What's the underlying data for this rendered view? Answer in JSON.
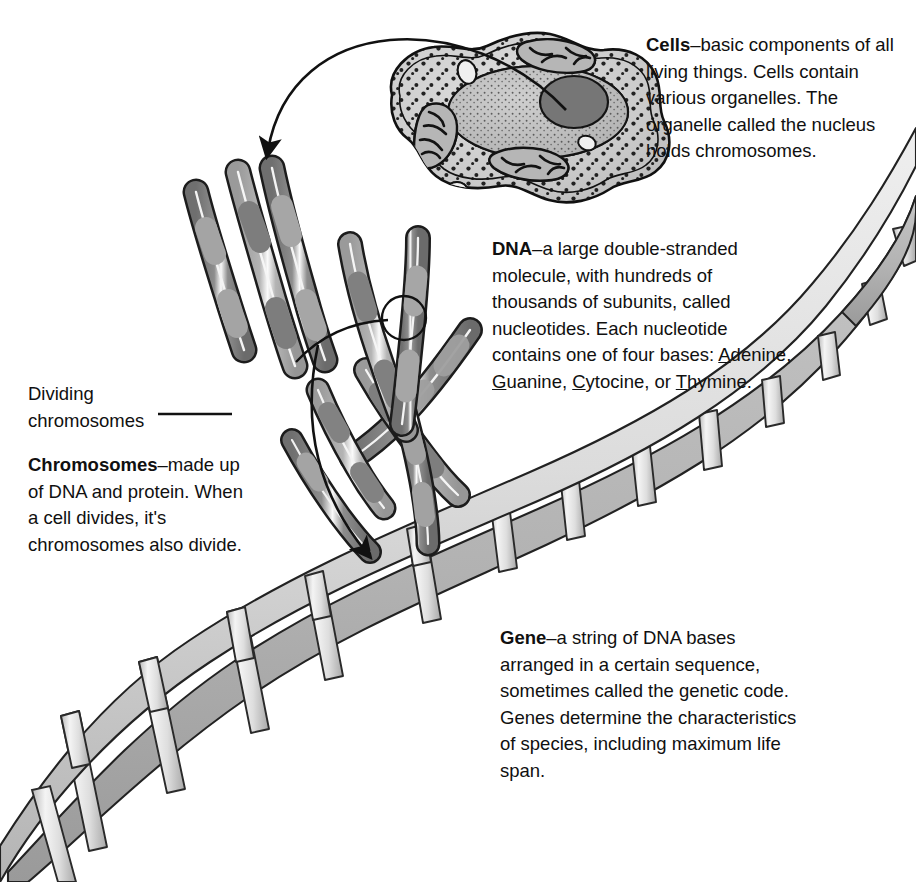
{
  "figure": {
    "background_color": "#ffffff",
    "text_color": "#101010"
  },
  "callouts": {
    "cells": {
      "term": "Cells",
      "dash": "–",
      "body": "basic components of all living things. Cells contain various organelles. The organelle called the nucleus holds chromosomes."
    },
    "dna": {
      "term": "DNA",
      "dash": "–",
      "body_part1": "a large double-stranded molecule, with hundreds of thousands of subunits, called nucleotides. Each nucleotide contains one of four bases: ",
      "bases": [
        {
          "initial": "A",
          "rest": "denine"
        },
        {
          "initial": "G",
          "rest": "uanine"
        },
        {
          "initial": "C",
          "rest": "ytocine"
        },
        {
          "initial": "T",
          "rest": "hymine"
        }
      ],
      "base_separator": ", ",
      "base_conjunction": "or ",
      "body_end": "."
    },
    "dividing": {
      "line1": "Dividing",
      "line2": "chromosomes"
    },
    "chromosomes": {
      "term": "Chromosomes",
      "dash": "–",
      "body": "made up of DNA and protein. When a cell divides, it's chromosomes also divide."
    },
    "gene": {
      "term": "Gene",
      "dash": "–",
      "body": "a string of DNA bases arranged in a certain sequence, sometimes called the genetic code. Genes determine the characteristics of species, including maximum life span."
    }
  },
  "illustrations": {
    "cell": {
      "name": "animal-cell",
      "membrane_fill": "#d0d0d0",
      "cytoplasm_fill": "#cbcbcb",
      "nucleus_fill": "#bdbdbd",
      "nucleolus_fill": "#7d7d7d",
      "outline": "#111111",
      "parts": [
        "cell-membrane",
        "cytoplasm",
        "nucleus",
        "nucleolus",
        "mitochondria",
        "ribosomes",
        "vacuoles"
      ],
      "mitochondria_count": 3,
      "ribosome_dot_count": 150
    },
    "chromosomes": {
      "name": "chromosome-set",
      "band_dark": "#7f7f7f",
      "band_light": "#a9a9a9",
      "outline": "#1a1a1a",
      "highlight": "#f2f2f2",
      "upper_group_count": 4,
      "lower_group_count": 5
    },
    "detail_circle": {
      "name": "chromosome-tip-detail-circle",
      "outline": "#111111"
    },
    "dna_helix": {
      "name": "dna-double-helix",
      "ribbon_light": "#e2e2e2",
      "ribbon_mid": "#c2c2c2",
      "ribbon_dark": "#9d9d9d",
      "rung_light": "#f0f0f0",
      "rung_mid": "#cfcfcf",
      "outline": "#222222",
      "rung_count": 14,
      "orientation": "lower-left to upper-right"
    },
    "arrows": {
      "nucleus_to_chromosomes": "curved-arrow",
      "chromosomes_to_dna": "curved-arrow",
      "dividing_chromosomes_leader": "straight-leader-line",
      "detail_circle_leader": "curved-leader-line"
    }
  }
}
